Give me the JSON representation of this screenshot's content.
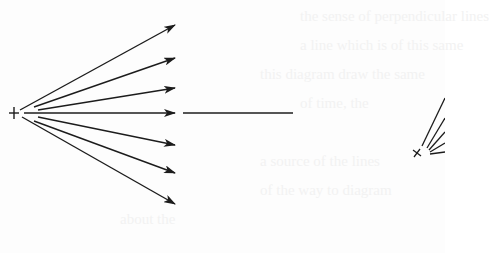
{
  "figure": {
    "type": "field-lines-diagram",
    "stroke_color": "#1c1c1c",
    "background_color": "#fdfdfd",
    "left_source": {
      "symbol": "+",
      "x": 14,
      "y": 113,
      "arrows": [
        {
          "x1": 20,
          "y1": 110,
          "x2": 175,
          "y2": 25
        },
        {
          "x1": 34,
          "y1": 107,
          "x2": 175,
          "y2": 58
        },
        {
          "x1": 38,
          "y1": 110,
          "x2": 175,
          "y2": 88
        },
        {
          "x1": 24,
          "y1": 113,
          "x2": 175,
          "y2": 113
        },
        {
          "x1": 38,
          "y1": 117,
          "x2": 175,
          "y2": 145
        },
        {
          "x1": 34,
          "y1": 121,
          "x2": 175,
          "y2": 173
        },
        {
          "x1": 22,
          "y1": 117,
          "x2": 175,
          "y2": 204
        }
      ]
    },
    "extension_line": {
      "x1": 183,
      "y1": 113,
      "x2": 293,
      "y2": 113
    },
    "right_source": {
      "symbol": "×",
      "x": 417,
      "y": 153,
      "lines": [
        {
          "x1": 422,
          "y1": 146,
          "x2": 445,
          "y2": 98
        },
        {
          "x1": 427,
          "y1": 148,
          "x2": 445,
          "y2": 118
        },
        {
          "x1": 429,
          "y1": 150,
          "x2": 445,
          "y2": 132
        },
        {
          "x1": 430,
          "y1": 152,
          "x2": 445,
          "y2": 143
        },
        {
          "x1": 430,
          "y1": 154,
          "x2": 445,
          "y2": 152
        }
      ]
    }
  },
  "bleed_through_text": [
    "the sense of perpendicular lines",
    "a line which is of this same",
    "this diagram draw the same",
    "of time, the",
    "a source of the lines",
    "of the way to diagram",
    "about the"
  ]
}
